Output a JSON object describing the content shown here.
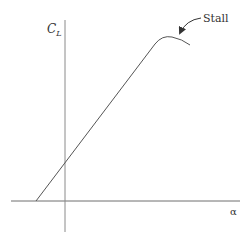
{
  "diagram": {
    "y_axis_label": {
      "main": "C",
      "subscript": "L"
    },
    "x_axis_label": "α",
    "annotation": "Stall",
    "colors": {
      "axis": "#7a7a7a",
      "curve": "#555555",
      "text": "#333333",
      "background": "#ffffff"
    }
  }
}
